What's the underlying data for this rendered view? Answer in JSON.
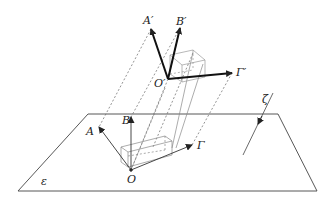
{
  "figure": {
    "plane_label": "ε",
    "line_label": "ζ",
    "original_frame": {
      "origin": "O",
      "axes": [
        "A",
        "B",
        "Γ"
      ]
    },
    "projected_frame": {
      "origin": "O′",
      "axes": [
        "A′",
        "B′",
        "Γ′"
      ]
    }
  },
  "colors": {
    "stroke": "#222222",
    "thin": "#555555",
    "dashed": "#666666",
    "box": "#888888"
  }
}
